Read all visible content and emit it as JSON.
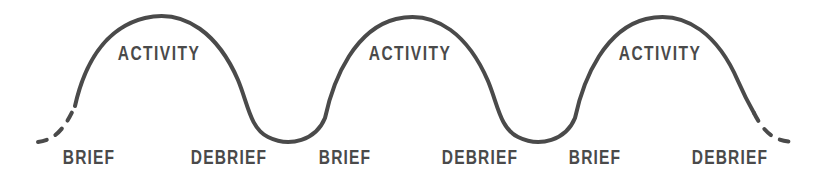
{
  "diagram": {
    "type": "process-cycle-wave",
    "background_color": "#ffffff",
    "stroke_color": "#4a4a4a",
    "text_color": "#4a4a4a",
    "stroke_width": 4,
    "cycle_count": 3
  },
  "chart_data": {
    "type": "line",
    "title": "",
    "xlabel": "",
    "ylabel": "",
    "grid": false,
    "legend": "none",
    "xlim": [
      0,
      838
    ],
    "ylim": [
      187,
      0
    ],
    "series": [
      {
        "name": "engagement-wave",
        "style": "solid",
        "points": [
          [
            75,
            105
          ],
          [
            92,
            62
          ],
          [
            112,
            33
          ],
          [
            140,
            19
          ],
          [
            168,
            17
          ],
          [
            200,
            26
          ],
          [
            226,
            52
          ],
          [
            244,
            88
          ],
          [
            252,
            118
          ],
          [
            264,
            134
          ],
          [
            286,
            139
          ],
          [
            312,
            137
          ],
          [
            326,
            124
          ],
          [
            334,
            96
          ],
          [
            344,
            62
          ],
          [
            362,
            35
          ],
          [
            390,
            20
          ],
          [
            420,
            17
          ],
          [
            450,
            24
          ],
          [
            476,
            50
          ],
          [
            494,
            88
          ],
          [
            502,
            118
          ],
          [
            514,
            134
          ],
          [
            536,
            139
          ],
          [
            562,
            137
          ],
          [
            576,
            124
          ],
          [
            584,
            96
          ],
          [
            594,
            62
          ],
          [
            612,
            35
          ],
          [
            640,
            20
          ],
          [
            670,
            17
          ],
          [
            700,
            26
          ],
          [
            726,
            52
          ],
          [
            744,
            88
          ],
          [
            754,
            112
          ]
        ]
      },
      {
        "name": "left-entry-dashes",
        "style": "dashed",
        "points": [
          [
            40,
            141
          ],
          [
            56,
            136
          ],
          [
            64,
            128
          ],
          [
            72,
            114
          ]
        ]
      },
      {
        "name": "right-exit-dashes",
        "style": "dashed",
        "points": [
          [
            756,
            114
          ],
          [
            766,
            128
          ],
          [
            776,
            136
          ],
          [
            792,
            141
          ]
        ]
      }
    ],
    "peaks": [
      {
        "label": "ACTIVITY",
        "x": 159,
        "y": 17
      },
      {
        "label": "ACTIVITY",
        "x": 410,
        "y": 17
      },
      {
        "label": "ACTIVITY",
        "x": 660,
        "y": 17
      }
    ],
    "troughs": [
      {
        "label": "BRIEF",
        "x": 78,
        "y": 141
      },
      {
        "label": "DEBRIEF",
        "x": 240,
        "y": 139
      },
      {
        "label": "BRIEF",
        "x": 330,
        "y": 139
      },
      {
        "label": "DEBRIEF",
        "x": 490,
        "y": 139
      },
      {
        "label": "BRIEF",
        "x": 580,
        "y": 139
      },
      {
        "label": "DEBRIEF",
        "x": 742,
        "y": 139
      }
    ]
  },
  "labels": {
    "activity": [
      {
        "text": "ACTIVITY",
        "x": 159,
        "y": 42
      },
      {
        "text": "ACTIVITY",
        "x": 410,
        "y": 42
      },
      {
        "text": "ACTIVITY",
        "x": 660,
        "y": 42
      }
    ],
    "phases": [
      {
        "text": "BRIEF",
        "x": 89,
        "y": 146
      },
      {
        "text": "DEBRIEF",
        "x": 229,
        "y": 146
      },
      {
        "text": "BRIEF",
        "x": 345,
        "y": 146
      },
      {
        "text": "DEBRIEF",
        "x": 480,
        "y": 146
      },
      {
        "text": "BRIEF",
        "x": 595,
        "y": 146
      },
      {
        "text": "DEBRIEF",
        "x": 730,
        "y": 146
      }
    ]
  }
}
